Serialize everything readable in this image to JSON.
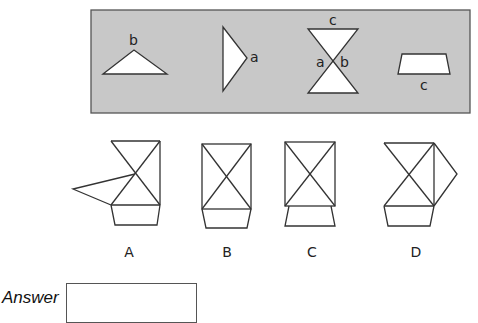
{
  "puzzle": {
    "panel": {
      "background": "#c8c8c8",
      "pieces": [
        {
          "id": "triangle-b",
          "shape": "obtuse triangle",
          "edge_label": "b"
        },
        {
          "id": "triangle-a",
          "shape": "right-pointing triangle",
          "edge_label": "a"
        },
        {
          "id": "hourglass",
          "shape": "two triangles meeting at a point",
          "edge_labels": [
            "c",
            "a",
            "b"
          ]
        },
        {
          "id": "trapezoid-c",
          "shape": "trapezoid",
          "edge_label": "c"
        }
      ],
      "labels": {
        "b_top": "b",
        "a_right": "a",
        "c_hourglass": "c",
        "a_hourglass": "a",
        "b_hourglass": "b",
        "c_trapezoid": "c"
      }
    },
    "options": [
      {
        "label": "A"
      },
      {
        "label": "B"
      },
      {
        "label": "C"
      },
      {
        "label": "D"
      }
    ]
  },
  "answer": {
    "label": "Answer",
    "value": ""
  }
}
